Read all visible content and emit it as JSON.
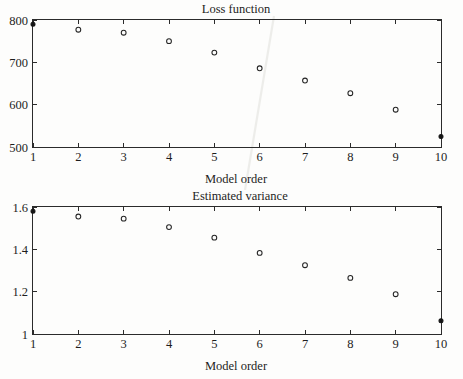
{
  "figure": {
    "background_color": "#fdfdfc",
    "foreground_color": "#1d1d1d"
  },
  "panels": [
    {
      "id": "loss",
      "title": "Loss function",
      "xlabel": "Model order",
      "x_ticks": [
        "1",
        "2",
        "3",
        "4",
        "5",
        "6",
        "7",
        "8",
        "9",
        "10"
      ],
      "y_ticks": [
        "500",
        "600",
        "700",
        "800"
      ]
    },
    {
      "id": "variance",
      "title": "Estimated variance",
      "xlabel": "Model order",
      "x_ticks": [
        "1",
        "2",
        "3",
        "4",
        "5",
        "6",
        "7",
        "8",
        "9",
        "10"
      ],
      "y_ticks": [
        "1",
        "1.2",
        "1.4",
        "1.6"
      ]
    }
  ],
  "chart_data": [
    {
      "type": "scatter",
      "id": "loss",
      "title": "Loss function",
      "xlabel": "Model order",
      "ylabel": "",
      "x": [
        1,
        2,
        3,
        4,
        5,
        6,
        7,
        8,
        9,
        10
      ],
      "values": [
        790,
        777,
        770,
        750,
        723,
        686,
        657,
        627,
        588,
        525
      ],
      "marker_styles": [
        "filled",
        "open",
        "open",
        "open",
        "open",
        "open",
        "open",
        "open",
        "open",
        "filled"
      ],
      "xlim": [
        1,
        10
      ],
      "ylim": [
        500,
        800
      ],
      "xticks": [
        1,
        2,
        3,
        4,
        5,
        6,
        7,
        8,
        9,
        10
      ],
      "yticks": [
        500,
        600,
        700,
        800
      ],
      "grid": false,
      "legend": null,
      "box": true
    },
    {
      "type": "scatter",
      "id": "variance",
      "title": "Estimated variance",
      "xlabel": "Model order",
      "ylabel": "",
      "x": [
        1,
        2,
        3,
        4,
        5,
        6,
        7,
        8,
        9,
        10
      ],
      "values": [
        1.58,
        1.555,
        1.545,
        1.505,
        1.455,
        1.383,
        1.325,
        1.265,
        1.188,
        1.063
      ],
      "marker_styles": [
        "filled",
        "open",
        "open",
        "open",
        "open",
        "open",
        "open",
        "open",
        "open",
        "filled"
      ],
      "xlim": [
        1,
        10
      ],
      "ylim": [
        1,
        1.6
      ],
      "xticks": [
        1,
        2,
        3,
        4,
        5,
        6,
        7,
        8,
        9,
        10
      ],
      "yticks": [
        1,
        1.2,
        1.4,
        1.6
      ],
      "grid": false,
      "legend": null,
      "box": true
    }
  ]
}
